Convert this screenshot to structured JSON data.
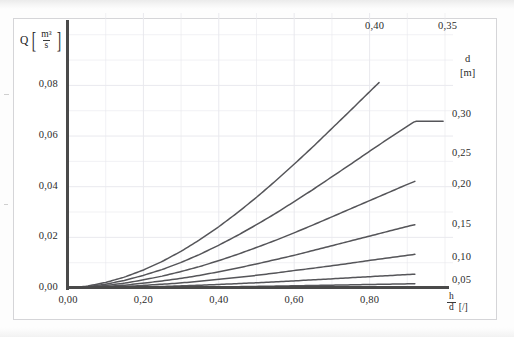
{
  "chart_data": {
    "type": "line",
    "title": "",
    "xlabel": "h/d [/]",
    "ylabel": "Q [m3/s]",
    "xlabel_parts": {
      "numerator": "h",
      "denominator": "d",
      "unit": "[/]"
    },
    "ylabel_parts": {
      "variable": "Q",
      "numerator": "m³",
      "denominator": "s"
    },
    "xlim": [
      0.0,
      1.0
    ],
    "ylim": [
      0.0,
      0.107
    ],
    "grid": true,
    "grid_x_step": 0.1,
    "grid_y_step": 0.01,
    "legend_position": "right",
    "legend_title": "d",
    "legend_title_unit": "[m]",
    "x_tick_labels": [
      "0,00",
      "0,20",
      "0,40",
      "0,60",
      "0,80"
    ],
    "x_tick_values": [
      0.0,
      0.2,
      0.4,
      0.6,
      0.8
    ],
    "y_tick_labels": [
      "0,00",
      "0,02",
      "0,04",
      "0,06",
      "0,08"
    ],
    "y_tick_values": [
      0.0,
      0.02,
      0.04,
      0.06,
      0.08
    ],
    "x": [
      0.0,
      0.05,
      0.1,
      0.15,
      0.2,
      0.25,
      0.3,
      0.35,
      0.4,
      0.45,
      0.5,
      0.55,
      0.6,
      0.65,
      0.7,
      0.75,
      0.8,
      0.85,
      0.9,
      0.92
    ],
    "series": [
      {
        "name": "0,40",
        "label": "0,40",
        "diameter_m": 0.4,
        "label_position": "top",
        "x_end": 0.825,
        "values": [
          0.0,
          0.0007,
          0.0022,
          0.0043,
          0.0071,
          0.0105,
          0.0145,
          0.0191,
          0.0242,
          0.0298,
          0.0358,
          0.0422,
          0.0489,
          0.0558,
          0.063,
          0.0702,
          0.0775,
          0.0847,
          0.0917,
          0.0944
        ]
      },
      {
        "name": "0,35",
        "label": "0,35",
        "diameter_m": 0.35,
        "label_position": "top",
        "x_end": 0.995,
        "values": [
          0.0,
          0.0005,
          0.0015,
          0.003,
          0.005,
          0.0073,
          0.0101,
          0.0133,
          0.0169,
          0.0208,
          0.025,
          0.0294,
          0.0341,
          0.0389,
          0.0439,
          0.0489,
          0.054,
          0.059,
          0.0639,
          0.0658
        ]
      },
      {
        "name": "0,30",
        "label": "0,30",
        "diameter_m": 0.3,
        "label_position": "right",
        "x_end": 0.92,
        "values": [
          0.0,
          0.0003,
          0.001,
          0.0019,
          0.0032,
          0.0047,
          0.0065,
          0.0085,
          0.0108,
          0.0133,
          0.016,
          0.0188,
          0.0218,
          0.0249,
          0.0281,
          0.0313,
          0.0345,
          0.0377,
          0.0409,
          0.0421
        ]
      },
      {
        "name": "0,25",
        "label": "0,25",
        "diameter_m": 0.25,
        "label_position": "right",
        "x_end": 0.92,
        "values": [
          0.0,
          0.0002,
          0.0006,
          0.0011,
          0.0019,
          0.0028,
          0.0038,
          0.005,
          0.0064,
          0.0079,
          0.0095,
          0.0112,
          0.0129,
          0.0148,
          0.0167,
          0.0186,
          0.0205,
          0.0224,
          0.0243,
          0.025
        ]
      },
      {
        "name": "0,20",
        "label": "0,20",
        "diameter_m": 0.2,
        "label_position": "right",
        "x_end": 0.92,
        "values": [
          0.0,
          0.0001,
          0.0003,
          0.0006,
          0.001,
          0.0015,
          0.002,
          0.0027,
          0.0034,
          0.0042,
          0.005,
          0.0059,
          0.0069,
          0.0078,
          0.0088,
          0.0098,
          0.0109,
          0.0119,
          0.0129,
          0.0133
        ]
      },
      {
        "name": "0,15",
        "label": "0,15",
        "diameter_m": 0.15,
        "label_position": "right",
        "x_end": 0.92,
        "values": [
          0.0,
          5e-05,
          0.00013,
          0.00025,
          0.00042,
          0.00061,
          0.00084,
          0.0011,
          0.0014,
          0.00172,
          0.00207,
          0.00243,
          0.00282,
          0.00322,
          0.00363,
          0.00405,
          0.00447,
          0.00489,
          0.00531,
          0.00547
        ]
      },
      {
        "name": "0,10",
        "label": "0,10",
        "diameter_m": 0.1,
        "label_position": "right",
        "x_end": 0.92,
        "values": [
          0.0,
          1e-05,
          4e-05,
          8e-05,
          0.00013,
          0.00019,
          0.00026,
          0.00034,
          0.00043,
          0.00053,
          0.00064,
          0.00075,
          0.00087,
          0.001,
          0.00112,
          0.00125,
          0.00138,
          0.00151,
          0.00164,
          0.00169
        ]
      },
      {
        "name": "0,05",
        "label": "0,05",
        "diameter_m": 0.05,
        "label_position": "right",
        "x_end": 0.92,
        "values": [
          0.0,
          2e-06,
          6e-06,
          1.2e-05,
          2e-05,
          3e-05,
          4e-05,
          5e-05,
          7e-05,
          8e-05,
          0.0001,
          0.00012,
          0.00014,
          0.00016,
          0.00018,
          0.0002,
          0.00022,
          0.00024,
          0.00026,
          0.00027
        ]
      }
    ]
  },
  "style": {
    "curve_color": "#555559",
    "grid_color": "#e9e9ee",
    "axis_color": "#4a4a4a",
    "frame_color": "#d5d5d8",
    "text_color": "#2b2b2b",
    "plot_background": "#ffffff"
  }
}
